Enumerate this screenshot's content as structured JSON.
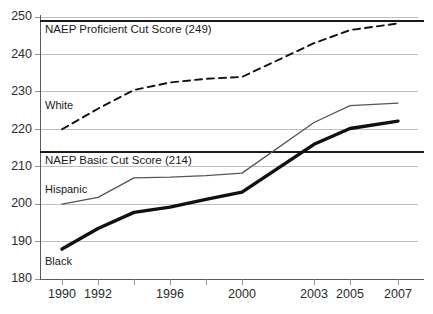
{
  "chart_data": {
    "type": "line",
    "title": "",
    "xlabel": "",
    "ylabel": "",
    "x": [
      1990,
      1992,
      1994,
      1996,
      1998,
      2000,
      2003,
      2005,
      2007
    ],
    "categories": [
      "1990",
      "1992",
      "1994",
      "1996",
      "1998",
      "2000",
      "2003",
      "2005",
      "2007"
    ],
    "xlim": [
      1989,
      2008
    ],
    "ylim": [
      180,
      250
    ],
    "grid": true,
    "legend_position": "inline-labels",
    "series": [
      {
        "name": "White",
        "style": "dashed",
        "color": "#111111",
        "values": [
          220,
          225.5,
          230.5,
          232.5,
          233.5,
          234,
          243,
          246.5,
          248.3
        ]
      },
      {
        "name": "Hispanic",
        "style": "thin-solid",
        "color": "#4a4a4a",
        "values": [
          200,
          201.8,
          207,
          207.2,
          207.6,
          208.3,
          221.8,
          226.3,
          227
        ]
      },
      {
        "name": "Black",
        "style": "thick-solid",
        "color": "#101010",
        "values": [
          188,
          193.5,
          197.8,
          199.2,
          201.3,
          203.2,
          216,
          220.2,
          222.2
        ]
      }
    ],
    "reference_lines": [
      {
        "label": "NAEP Proficient Cut Score (249)",
        "value": 249,
        "color": "#1a1a1a"
      },
      {
        "label": "NAEP Basic Cut Score (214)",
        "value": 214,
        "color": "#1a1a1a"
      }
    ],
    "yticks": [
      180,
      190,
      200,
      210,
      220,
      230,
      240,
      250
    ],
    "ytick_labels": [
      "180",
      "190",
      "200",
      "210",
      "220",
      "230",
      "240",
      "250"
    ],
    "xtick_labels": [
      "1990",
      "1992",
      "1996",
      "2000",
      "2003",
      "2005",
      "2007"
    ]
  },
  "axis": {
    "y": {
      "t250": "250",
      "t240": "240",
      "t230": "230",
      "t220": "220",
      "t210": "210",
      "t200": "200",
      "t190": "190",
      "t180": "180"
    },
    "x": {
      "t1990": "1990",
      "t1992": "1992",
      "t1996": "1996",
      "t2000": "2000",
      "t2003": "2003",
      "t2005": "2005",
      "t2007": "2007"
    }
  },
  "annotations": {
    "proficient_cut": "NAEP Proficient Cut Score (249)",
    "basic_cut": "NAEP Basic Cut Score (214)",
    "white_label": "White",
    "hispanic_label": "Hispanic",
    "black_label": "Black"
  }
}
